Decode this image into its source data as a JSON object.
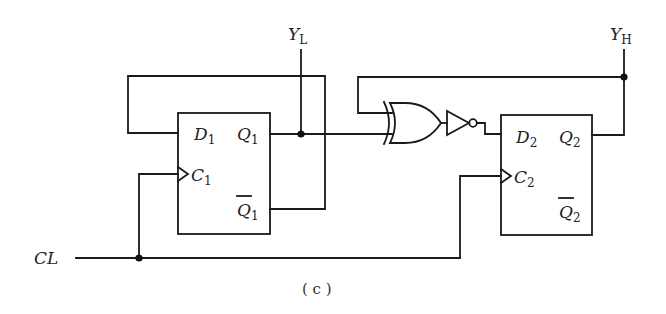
{
  "diagram": {
    "type": "digital-logic-circuit",
    "caption": "( c )",
    "input": {
      "label": "CL"
    },
    "outputs": [
      {
        "label": "Y",
        "sub": "L"
      },
      {
        "label": "Y",
        "sub": "H"
      }
    ],
    "flipflops": [
      {
        "id": "ff1",
        "pins": {
          "d": {
            "label": "D",
            "sub": "1"
          },
          "c": {
            "label": "C",
            "sub": "1"
          },
          "q": {
            "label": "Q",
            "sub": "1"
          },
          "qbar": {
            "label": "Q",
            "sub": "1"
          }
        }
      },
      {
        "id": "ff2",
        "pins": {
          "d": {
            "label": "D",
            "sub": "2"
          },
          "c": {
            "label": "C",
            "sub": "2"
          },
          "q": {
            "label": "Q",
            "sub": "2"
          },
          "qbar": {
            "label": "Q",
            "sub": "2"
          }
        }
      }
    ],
    "gates": [
      {
        "type": "XOR",
        "inputs": [
          "Q2 (feedback)",
          "Q1"
        ]
      },
      {
        "type": "NOT",
        "input": "XOR output",
        "output": "D2"
      }
    ]
  }
}
